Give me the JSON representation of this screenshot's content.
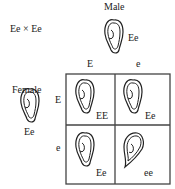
{
  "cross": "Ee × Ee",
  "male": {
    "title": "Male",
    "genotype": "Ee"
  },
  "female": {
    "title": "Female",
    "genotype": "Ee"
  },
  "male_alleles": [
    "E",
    "e"
  ],
  "female_alleles": [
    "E",
    "e"
  ],
  "grid": [
    [
      {
        "genotype": "EE",
        "earlobe": "free"
      },
      {
        "genotype": "Ee",
        "earlobe": "free"
      }
    ],
    [
      {
        "genotype": "Ee",
        "earlobe": "free"
      },
      {
        "genotype": "ee",
        "earlobe": "attached"
      }
    ]
  ]
}
